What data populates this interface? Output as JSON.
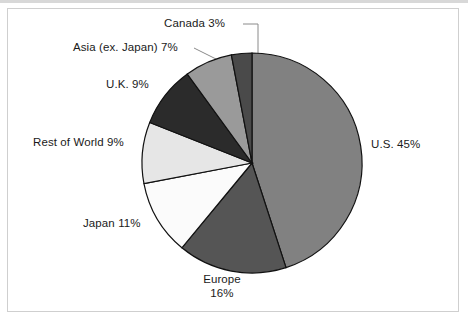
{
  "chart_data": {
    "type": "pie",
    "title": "",
    "subtitle": "",
    "xlabel": "",
    "ylabel": "",
    "legend_position": "none",
    "grid": false,
    "labels_show_percent": true,
    "categories": [
      "U.S.",
      "Europe",
      "Japan",
      "Rest of World",
      "U.K.",
      "Asia (ex. Japan)",
      "Canada"
    ],
    "values": [
      45,
      16,
      11,
      9,
      9,
      7,
      3
    ],
    "unit": "%",
    "start_angle_deg": 0,
    "direction": "clockwise",
    "slices": [
      {
        "name": "U.S.",
        "value": 45,
        "label": "U.S. 45%",
        "color": "#818181",
        "start_deg": 0,
        "end_deg": 162
      },
      {
        "name": "Europe",
        "value": 16,
        "label_line1": "Europe",
        "label_line2": "16%",
        "label": "Europe 16%",
        "color": "#555555",
        "start_deg": 162,
        "end_deg": 219.6
      },
      {
        "name": "Japan",
        "value": 11,
        "label": "Japan 11%",
        "color": "#fbfbfb",
        "start_deg": 219.6,
        "end_deg": 259.2
      },
      {
        "name": "Rest of World",
        "value": 9,
        "label": "Rest of World 9%",
        "color": "#e6e6e6",
        "start_deg": 259.2,
        "end_deg": 291.6
      },
      {
        "name": "U.K.",
        "value": 9,
        "label": "U.K. 9%",
        "color": "#2b2b2b",
        "start_deg": 291.6,
        "end_deg": 324
      },
      {
        "name": "Asia (ex. Japan)",
        "value": 7,
        "label": "Asia (ex. Japan) 7%",
        "color": "#9a9a9a",
        "start_deg": 324,
        "end_deg": 349.2
      },
      {
        "name": "Canada",
        "value": 3,
        "label": "Canada 3%",
        "color": "#4a4a4a",
        "start_deg": 349.2,
        "end_deg": 360
      }
    ]
  },
  "labels": {
    "us": "U.S. 45%",
    "europe_line1": "Europe",
    "europe_line2": "16%",
    "japan": "Japan 11%",
    "rest_of_world": "Rest of World 9%",
    "uk": "U.K. 9%",
    "asia": "Asia (ex. Japan) 7%",
    "canada": "Canada 3%"
  },
  "style": {
    "slice_outline": "#111111",
    "frame_border": "#cfcfcf",
    "background": "#ffffff",
    "text_color": "#1a1a1a",
    "leader_line": "#8a8a8a"
  }
}
